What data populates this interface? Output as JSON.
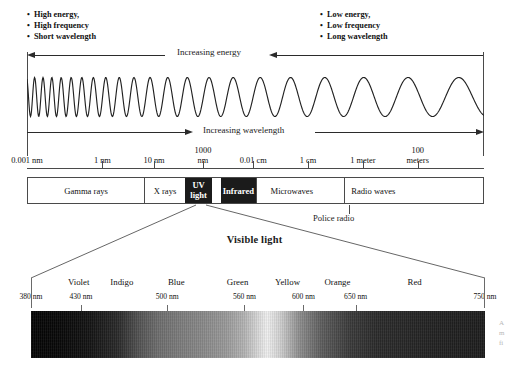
{
  "top": {
    "left_bullets": [
      "High energy,",
      "High frequency",
      "Short wavelength"
    ],
    "right_bullets": [
      "Low energy,",
      "Low frequency",
      "Long wavelength"
    ],
    "energy_arrow_label": "Increasing energy",
    "wavelength_arrow_label": "Increasing wavelength"
  },
  "scale": {
    "ticks": [
      {
        "label": "0.001 nm",
        "pos": 0.0,
        "two_line": false,
        "tick": false
      },
      {
        "label": "1 nm",
        "pos": 0.165,
        "two_line": false,
        "tick": true
      },
      {
        "label": "10 nm",
        "pos": 0.278,
        "two_line": false,
        "tick": true
      },
      {
        "label": "1000\nnm",
        "line1": "1000",
        "line2": "nm",
        "pos": 0.385,
        "two_line": true,
        "tick": true
      },
      {
        "label": "0.01 cm",
        "pos": 0.495,
        "two_line": false,
        "tick": true
      },
      {
        "label": "1 cm",
        "pos": 0.615,
        "two_line": false,
        "tick": true
      },
      {
        "label": "1 meter",
        "pos": 0.735,
        "two_line": false,
        "tick": true
      },
      {
        "label": "100\nmeters",
        "line1": "100",
        "line2": "meters",
        "pos": 0.855,
        "two_line": true,
        "tick": true
      }
    ]
  },
  "bands": [
    {
      "name": "Gamma rays",
      "start": 0.0,
      "end": 0.255,
      "style": "light",
      "two_line": false
    },
    {
      "name": "X rays",
      "start": 0.255,
      "end": 0.345,
      "style": "light",
      "two_line": false
    },
    {
      "name": "UV light",
      "line1": "UV",
      "line2": "light",
      "start": 0.345,
      "end": 0.405,
      "style": "dark",
      "two_line": true
    },
    {
      "name": "",
      "start": 0.405,
      "end": 0.425,
      "style": "visible-gap",
      "two_line": false
    },
    {
      "name": "Infrared",
      "start": 0.425,
      "end": 0.5,
      "style": "dark",
      "two_line": false
    },
    {
      "name": "Microwaves",
      "start": 0.5,
      "end": 0.695,
      "style": "light",
      "two_line": false
    },
    {
      "name": "Radio waves",
      "start": 0.695,
      "end": 1.0,
      "style": "light-nosep",
      "two_line": false
    }
  ],
  "annotations": {
    "police_radio": "Police radio",
    "visible_light_title": "Visible light"
  },
  "visible": {
    "colors": [
      {
        "name": "Violet",
        "pos": 0.105
      },
      {
        "name": "Indigo",
        "pos": 0.2
      },
      {
        "name": "Blue",
        "pos": 0.32
      },
      {
        "name": "Green",
        "pos": 0.455
      },
      {
        "name": "Yellow",
        "pos": 0.565
      },
      {
        "name": "Orange",
        "pos": 0.675
      },
      {
        "name": "Red",
        "pos": 0.845
      }
    ],
    "wavelengths": [
      {
        "label": "380 nm",
        "pos": 0.0,
        "tick": false
      },
      {
        "label": "430 nm",
        "pos": 0.11,
        "tick": true
      },
      {
        "label": "500 nm",
        "pos": 0.3,
        "tick": true
      },
      {
        "label": "560 nm",
        "pos": 0.47,
        "tick": true
      },
      {
        "label": "600 nm",
        "pos": 0.6,
        "tick": true
      },
      {
        "label": "650 nm",
        "pos": 0.715,
        "tick": true
      },
      {
        "label": "750 nm",
        "pos": 1.0,
        "tick": false
      }
    ]
  },
  "colors": {
    "ink": "#1a1a1a",
    "rule": "#4a4a4a",
    "dark_band_bg": "#1b1b1b",
    "dark_band_fg": "#ffffff",
    "page_bg": "#ffffff"
  },
  "edge_text": "A\nm\nfi"
}
